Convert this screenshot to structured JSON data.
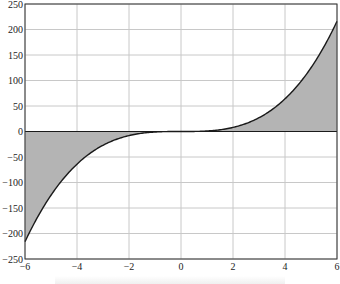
{
  "chart_data": {
    "type": "area",
    "title": "",
    "xlabel": "",
    "ylabel": "",
    "function": "y = x^3",
    "xlim": [
      -6,
      6
    ],
    "ylim": [
      -250,
      250
    ],
    "grid": true,
    "legend": null,
    "x_ticks": [
      -6,
      -4,
      -2,
      0,
      2,
      4,
      6
    ],
    "y_ticks": [
      250,
      200,
      150,
      100,
      50,
      0,
      -50,
      -100,
      -150,
      -200,
      -250
    ],
    "x_tick_labels": [
      "−6",
      "−4",
      "−2",
      "0",
      "2",
      "4",
      "6"
    ],
    "y_tick_labels": [
      "250",
      "200",
      "150",
      "100",
      "50",
      "0",
      "−50",
      "−100",
      "−150",
      "−200",
      "−250"
    ],
    "series": [
      {
        "name": "y = x^3",
        "x": [
          -6,
          -5,
          -4,
          -3,
          -2,
          -1,
          0,
          1,
          2,
          3,
          4,
          5,
          6
        ],
        "values": [
          -216,
          -125,
          -64,
          -27,
          -8,
          -1,
          0,
          1,
          8,
          27,
          64,
          125,
          216
        ],
        "fill_to": 0
      }
    ],
    "colors": {
      "fill": "#b4b4b4",
      "line": "#1a1a1a",
      "grid": "#c8c8c8",
      "axis": "#333333"
    }
  }
}
